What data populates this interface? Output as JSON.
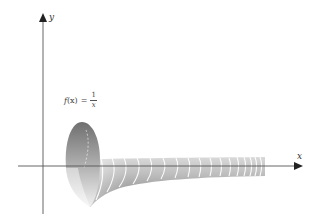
{
  "figure": {
    "axes": {
      "x_label": "x",
      "y_label": "y"
    },
    "formula": {
      "lhs_func": "f",
      "lhs_var": "(x)",
      "equals": "=",
      "numerator": "1",
      "denominator": "x"
    },
    "colors": {
      "axis": "#555555",
      "surface_dark": "#7a7a7a",
      "surface_light": "#e6e6e6",
      "ribs": "#ffffff",
      "background": "#ffffff"
    }
  }
}
